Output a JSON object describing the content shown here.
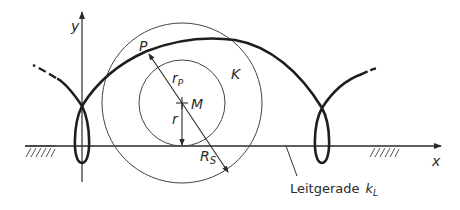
{
  "figure": {
    "type": "trochoid construction (verschlungene Zykloide)",
    "labels": {
      "y_axis": "y",
      "x_axis": "x",
      "point_p": "P",
      "center_m": "M",
      "circle_k": "K",
      "radius_rp_main": "r",
      "radius_rp_sub": "P",
      "radius_r": "r",
      "radius_rs_main": "R",
      "radius_rs_sub": "S",
      "guide_line_text": "Leitgerade",
      "guide_line_symbol_main": "k",
      "guide_line_symbol_sub": "L"
    },
    "colors": {
      "curve": "#1e1e1e",
      "lines": "#3a3a3a",
      "background": "#ffffff"
    }
  }
}
